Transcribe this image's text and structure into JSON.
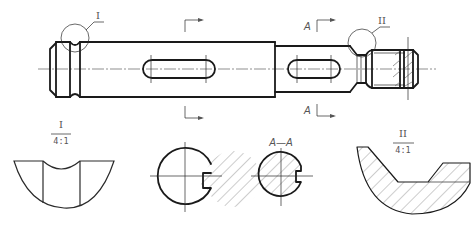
{
  "drawing": {
    "title": "Shaft part drawing with sections and detail views",
    "main_view": {
      "detail_marker_1": "I",
      "detail_marker_2": "II",
      "section_label_left": "A",
      "section_label_top": "A",
      "section_label_bottom": "A"
    },
    "detail_view_1": {
      "label": "I",
      "scale": "4:1"
    },
    "section_view_1": {
      "label": ""
    },
    "section_view_2": {
      "label": "A—A"
    },
    "detail_view_2": {
      "label": "II",
      "scale": "4:1"
    },
    "colors": {
      "line": "#1a1a1a",
      "thin_line": "#555555",
      "background": "#ffffff"
    }
  }
}
